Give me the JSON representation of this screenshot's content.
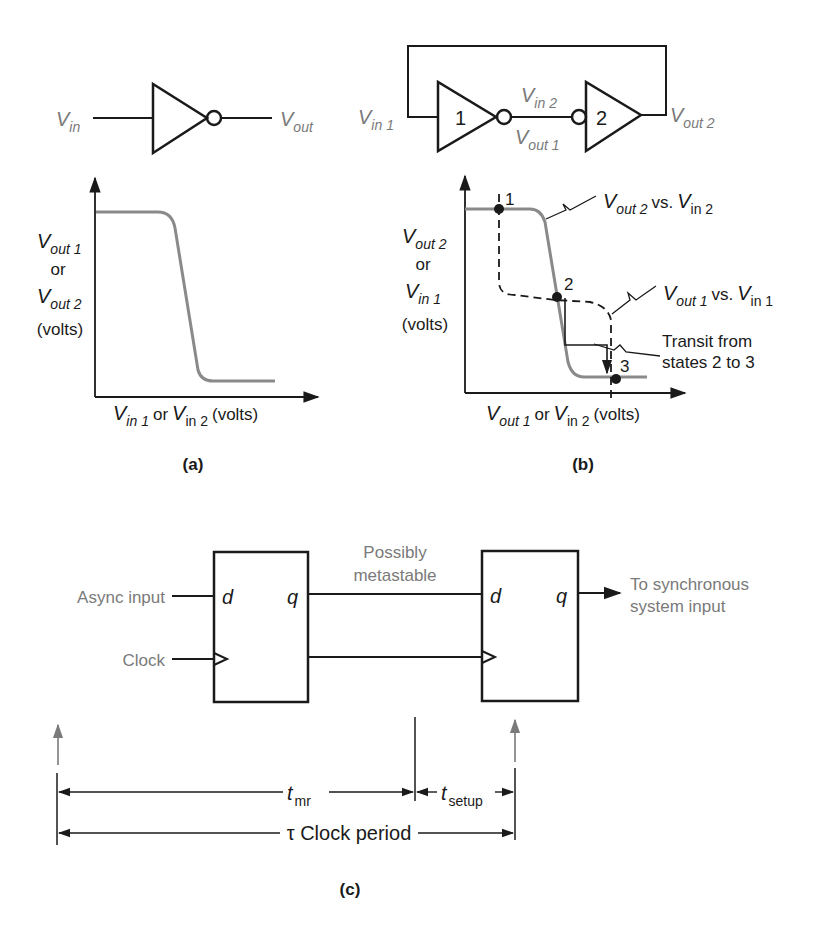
{
  "figure": {
    "panel_a": {
      "caption": "(a)",
      "inverter": {
        "input_label": {
          "v": "V",
          "sub": "in"
        },
        "output_label": {
          "v": "V",
          "sub": "out"
        }
      },
      "graph": {
        "y_label": [
          {
            "v": "V",
            "sub": "out 1"
          },
          {
            "text": "or"
          },
          {
            "v": "V",
            "sub": "out 2"
          },
          {
            "text": "(volts)"
          }
        ],
        "x_label": {
          "v1": "V",
          "sub1": "in 1",
          "or": "or",
          "v2": "V",
          "sub2": "in 2",
          "unit": "(volts)"
        }
      }
    },
    "panel_b": {
      "caption": "(b)",
      "circuit": {
        "vin1": {
          "v": "V",
          "sub": "in 1"
        },
        "vin2": {
          "v": "V",
          "sub": "in 2"
        },
        "vout1": {
          "v": "V",
          "sub": "out 1"
        },
        "vout2": {
          "v": "V",
          "sub": "out 2"
        },
        "gate1_label": "1",
        "gate2_label": "2"
      },
      "graph": {
        "y_label": [
          {
            "v": "V",
            "sub": "out 2"
          },
          {
            "text": "or"
          },
          {
            "v": "V",
            "sub": "in 1"
          },
          {
            "text": "(volts)"
          }
        ],
        "x_label": {
          "v1": "V",
          "sub1": "out 1",
          "or": "or",
          "v2": "V",
          "sub2": "in 2",
          "unit": "(volts)"
        },
        "curve1_label": {
          "v1": "V",
          "sub1": "out 2",
          "vs": "vs.",
          "v2": "V",
          "sub2": "in 2"
        },
        "curve2_label": {
          "v1": "V",
          "sub1": "out 1",
          "vs": "vs.",
          "v2": "V",
          "sub2": "in 1"
        },
        "transit_label": [
          "Transit from",
          "states 2 to 3"
        ],
        "points": [
          "1",
          "2",
          "3"
        ]
      }
    },
    "panel_c": {
      "caption": "(c)",
      "ff1": {
        "d": "d",
        "q": "q"
      },
      "ff2": {
        "d": "d",
        "q": "q"
      },
      "async_input": "Async input",
      "clock": "Clock",
      "metastable": [
        "Possibly",
        "metastable"
      ],
      "output": [
        "To synchronous",
        "system input"
      ],
      "t_mr": {
        "t": "t",
        "sub": "mr"
      },
      "t_setup": {
        "t": "t",
        "sub": "setup"
      },
      "clock_period": "τ Clock period"
    }
  }
}
